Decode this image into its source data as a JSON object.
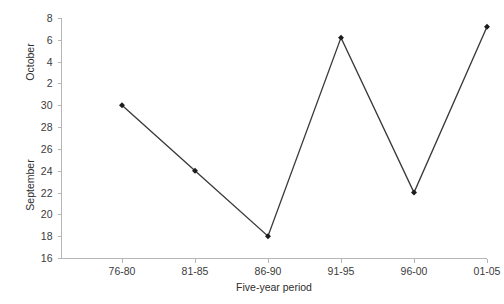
{
  "chart_data": {
    "type": "line",
    "title": "",
    "xlabel": "Five-year period",
    "ylabel_lower": "September",
    "ylabel_upper": "October",
    "categories": [
      "76-80",
      "81-85",
      "86-90",
      "91-95",
      "96-00",
      "01-05"
    ],
    "series": [
      {
        "name": "Date",
        "values": [
          30,
          24,
          18,
          6.2,
          22,
          7.2
        ],
        "value_labels": [
          "September 30",
          "September 24",
          "September 18",
          "October 6",
          "September 22",
          "October 7"
        ],
        "axis_positions": [
          30,
          24,
          18,
          36.2,
          22,
          37.2
        ]
      }
    ],
    "y_axis": {
      "ticks": [
        "16",
        "18",
        "20",
        "22",
        "24",
        "26",
        "28",
        "30",
        "2",
        "4",
        "6",
        "8"
      ],
      "tick_values": [
        16,
        18,
        20,
        22,
        24,
        26,
        28,
        30,
        32,
        34,
        36,
        38
      ],
      "ylim": [
        16,
        38
      ],
      "september_range": [
        16,
        30
      ],
      "october_range": [
        32,
        38
      ]
    },
    "x_axis": {
      "ticks": [
        "76-80",
        "81-85",
        "86-90",
        "91-95",
        "96-00",
        "01-05"
      ],
      "positions": [
        0,
        1,
        2,
        3,
        4,
        5
      ]
    },
    "grid": false,
    "legend": "none",
    "colors": {
      "line": "#3a3a3a",
      "marker": "#1c1c1c",
      "axis": "#b6b6b6",
      "text": "#3b3b3b",
      "background": "#ffffff"
    }
  }
}
